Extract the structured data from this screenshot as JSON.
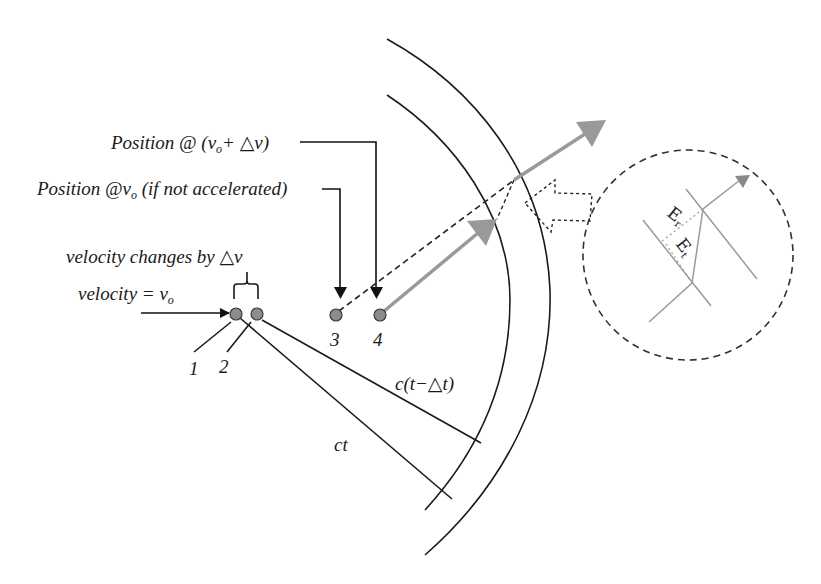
{
  "labels": {
    "position_accelerated": {
      "prefix": "Position @ (",
      "var": "v",
      "sub": "o",
      "suffix": "+ △v)"
    },
    "position_not_accelerated": {
      "prefix": "Position @",
      "var": "v",
      "sub": "o",
      "suffix": " (if not accelerated)"
    },
    "velocity_changes": "velocity changes by  △v",
    "velocity_initial": {
      "prefix": "velocity = ",
      "var": "v",
      "sub": "o"
    },
    "radius_delayed": "c(t−△t)",
    "radius_full": "ct",
    "inset_field_r": {
      "main": "E",
      "sub": "r"
    },
    "inset_field_t": {
      "main": "E",
      "sub": "t"
    }
  },
  "points": [
    {
      "id": "1",
      "label": "1"
    },
    {
      "id": "2",
      "label": "2"
    },
    {
      "id": "3",
      "label": "3"
    },
    {
      "id": "4",
      "label": "4"
    }
  ],
  "colors": {
    "line": "#1a1a1a",
    "arrow_gray": "#9a9a9a",
    "point_fill": "#8c8c8c",
    "dashed": "#222222"
  }
}
